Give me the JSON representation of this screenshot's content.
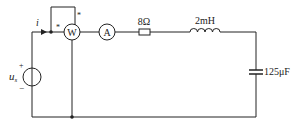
{
  "diagram": {
    "type": "circuit",
    "source": {
      "label_main": "u",
      "label_sub": "s",
      "plus": "+",
      "minus": "−"
    },
    "current_label": "i",
    "wattmeter": {
      "label": "W",
      "marker_current": "*",
      "marker_voltage": "*"
    },
    "ammeter": {
      "label": "A"
    },
    "resistor": {
      "label": "8Ω"
    },
    "inductor": {
      "label": "2mH"
    },
    "capacitor": {
      "label": "125μF"
    }
  },
  "colors": {
    "wire": "#222222",
    "background": "#ffffff"
  }
}
